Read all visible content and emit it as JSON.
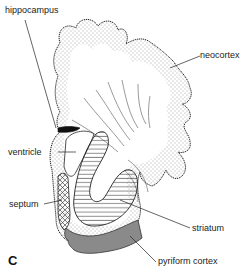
{
  "figure": {
    "panel_letter": "C",
    "labels": {
      "hippocampus": "hippocampus",
      "neocortex": "neocortex",
      "ventricle": "ventricle",
      "septum": "septum",
      "striatum": "striatum",
      "pyriform_cortex": "pyriform cortex"
    },
    "colors": {
      "outline": "#222222",
      "pyriform_fill": "#8a8a8a",
      "hippocampus_fill": "#111111",
      "stipple": "#444444"
    }
  }
}
